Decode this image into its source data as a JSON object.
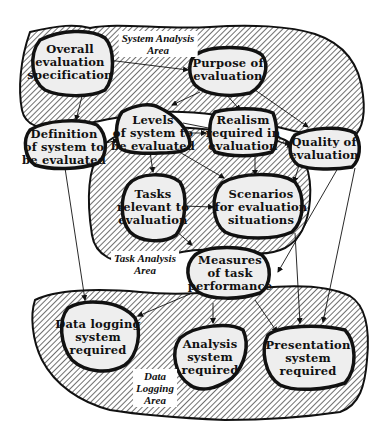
{
  "diagram": {
    "type": "flow-diagram",
    "colors": {
      "hatch": "#222222",
      "node_fill": "#eeeeee",
      "outline": "#111111",
      "background": "#ffffff"
    },
    "areas": [
      {
        "id": "system",
        "label": "System Analysis\nArea"
      },
      {
        "id": "task",
        "label": "Task Analysis\nArea"
      },
      {
        "id": "data",
        "label": "Data\nLogging\nArea"
      }
    ],
    "nodes": [
      {
        "id": "overall",
        "label": "Overall\nevaluation\nspecification",
        "area": "system"
      },
      {
        "id": "purpose",
        "label": "Purpose of\nevaluation",
        "area": "system"
      },
      {
        "id": "definition",
        "label": "Definition\nof system to\nbe evaluated",
        "area": "system"
      },
      {
        "id": "levels",
        "label": "Levels\nof system to\nbe evaluated",
        "area": "system"
      },
      {
        "id": "realism",
        "label": "Realism\nrequired in\nevaluation",
        "area": "system"
      },
      {
        "id": "quality",
        "label": "Quality of\nevaluation",
        "area": "system"
      },
      {
        "id": "tasks",
        "label": "Tasks\nrelevant to\nevaluation",
        "area": "task"
      },
      {
        "id": "scenarios",
        "label": "Scenarios\nfor evaluation\nsituations",
        "area": "task"
      },
      {
        "id": "measures",
        "label": "Measures\nof task\nperformance",
        "area": "task"
      },
      {
        "id": "datalog",
        "label": "Data logging\nsystem\nrequired",
        "area": "data"
      },
      {
        "id": "analysis",
        "label": "Analysis\nsystem\nrequired",
        "area": "data"
      },
      {
        "id": "presentation",
        "label": "Presentation\nsystem\nrequired",
        "area": "data"
      }
    ],
    "edges": [
      {
        "from": "overall",
        "to": "purpose"
      },
      {
        "from": "overall",
        "to": "definition"
      },
      {
        "from": "purpose",
        "to": "levels"
      },
      {
        "from": "purpose",
        "to": "realism"
      },
      {
        "from": "purpose",
        "to": "quality"
      },
      {
        "from": "definition",
        "to": "levels"
      },
      {
        "from": "levels",
        "to": "realism"
      },
      {
        "from": "levels",
        "to": "quality"
      },
      {
        "from": "levels",
        "to": "tasks"
      },
      {
        "from": "levels",
        "to": "scenarios"
      },
      {
        "from": "realism",
        "to": "quality"
      },
      {
        "from": "realism",
        "to": "scenarios"
      },
      {
        "from": "quality",
        "to": "scenarios"
      },
      {
        "from": "quality",
        "to": "measures"
      },
      {
        "from": "quality",
        "to": "presentation"
      },
      {
        "from": "tasks",
        "to": "scenarios"
      },
      {
        "from": "tasks",
        "to": "measures"
      },
      {
        "from": "definition",
        "to": "datalog"
      },
      {
        "from": "measures",
        "to": "datalog"
      },
      {
        "from": "measures",
        "to": "analysis"
      },
      {
        "from": "measures",
        "to": "presentation"
      },
      {
        "from": "scenarios",
        "to": "presentation"
      }
    ]
  }
}
